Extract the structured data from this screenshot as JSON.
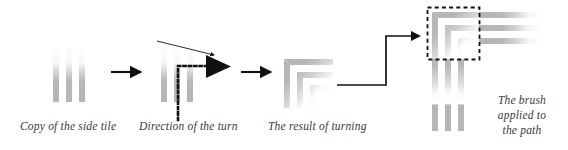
{
  "figure": {
    "background_color": "#ffffff",
    "stripe_color": "#b6b6b6",
    "ink_color": "#1a1a1a",
    "text_color": "#3a3a3a"
  },
  "steps": [
    {
      "id": "copy-side-tile",
      "label": "Copy of  the side tile",
      "graphic": "vertical-striped-tile-faded-top"
    },
    {
      "id": "direction-of-turn",
      "label": "Direction of the turn",
      "graphic": "vertical-striped-tile-with-dotted-L-path-and-arrowhead"
    },
    {
      "id": "result-of-turning",
      "label": "The result of turning",
      "graphic": "corner-tile-mitered-stripes"
    },
    {
      "id": "brush-applied",
      "label": "The brush\napplied to\nthe path",
      "label_lines": [
        "The brush",
        "applied to",
        "the path"
      ],
      "graphic": "corner-plus-side-tiles-with-dashed-selection-box"
    }
  ],
  "connectors": [
    {
      "id": "arrow-1",
      "type": "straight-arrow",
      "direction": "right"
    },
    {
      "id": "arrow-2",
      "type": "straight-arrow",
      "direction": "right"
    },
    {
      "id": "arrow-3",
      "type": "straight-arrow",
      "direction": "right"
    },
    {
      "id": "turn-indicator",
      "type": "thin-arrow-diagonal",
      "direction": "down-right"
    },
    {
      "id": "fat-triangle",
      "type": "solid-triangle-arrowhead",
      "direction": "right"
    },
    {
      "id": "elbow-arrow",
      "type": "elbow-arrow",
      "direction": "right-up-right"
    }
  ],
  "annotations": {
    "dotted_path": "dotted-L-shaped-path",
    "dashed_selection": "dashed-rectangle-selection"
  }
}
